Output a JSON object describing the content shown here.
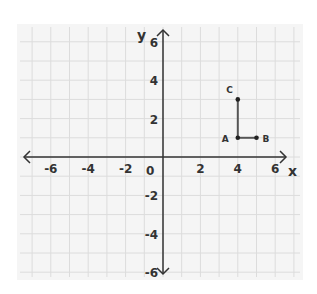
{
  "chart_data": {
    "type": "scatter",
    "title": "",
    "xlabel": "x",
    "ylabel": "y",
    "xlim": [
      -6,
      6
    ],
    "ylim": [
      -6,
      6
    ],
    "grid": true,
    "x_ticks": [
      -6,
      -4,
      -2,
      0,
      2,
      4,
      6
    ],
    "y_ticks": [
      -6,
      -4,
      -2,
      2,
      4,
      6
    ],
    "points": [
      {
        "label": "A",
        "x": 4,
        "y": 1
      },
      {
        "label": "B",
        "x": 5,
        "y": 1
      },
      {
        "label": "C",
        "x": 4,
        "y": 3
      }
    ],
    "segments": [
      {
        "from": "A",
        "to": "B"
      },
      {
        "from": "A",
        "to": "C"
      }
    ]
  },
  "axes": {
    "x_label": "x",
    "y_label": "y",
    "origin_label": "0"
  },
  "colors": {
    "panel": "#f5f5f5",
    "grid": "#dcdcdc",
    "axis": "#333333",
    "segment": "#555555"
  }
}
